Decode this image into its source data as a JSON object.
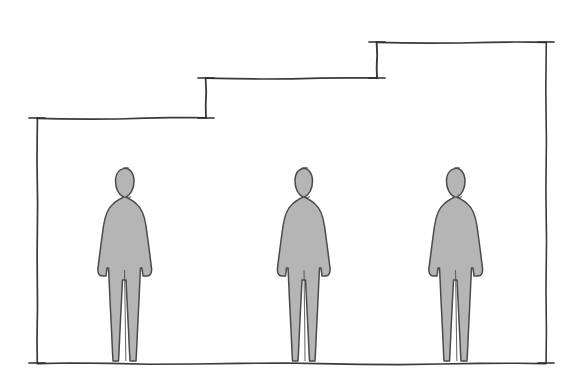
{
  "canvas": {
    "width": 583,
    "height": 389,
    "background_color": "#ffffff",
    "title": "Stepped height diagram with three standing human figures"
  },
  "style": {
    "line_color": "#3a3a3a",
    "line_width": 1.6,
    "tick_color": "#2e2e2e",
    "figure_fill": "#b5b5b5",
    "figure_stroke": "#4a4a4a",
    "figure_stroke_width": 1.5,
    "ground_color": "#3a3a3a"
  },
  "chart_data": {
    "type": "diagram",
    "title": "",
    "xlabel": "",
    "ylabel": "",
    "ground_y": 363,
    "steps": [
      {
        "name": "step-low",
        "y": 118,
        "x_start": 37,
        "x_end": 206,
        "height_px": 245
      },
      {
        "name": "step-mid",
        "y": 78,
        "x_start": 206,
        "x_end": 377,
        "height_px": 285
      },
      {
        "name": "step-high",
        "y": 42,
        "x_start": 377,
        "x_end": 546,
        "height_px": 321
      }
    ],
    "risers": [
      {
        "name": "riser-left",
        "x": 37,
        "y_top": 118,
        "y_bottom": 363
      },
      {
        "name": "riser-1",
        "x": 206,
        "y_top": 78,
        "y_bottom": 118
      },
      {
        "name": "riser-2",
        "x": 377,
        "y_top": 42,
        "y_bottom": 78
      },
      {
        "name": "riser-right",
        "x": 546,
        "y_top": 42,
        "y_bottom": 363
      }
    ],
    "tick_marks": [
      {
        "name": "tick-left-top",
        "x": 37,
        "y": 118,
        "orientation": "horizontal"
      },
      {
        "name": "tick-left-bottom",
        "x": 37,
        "y": 363,
        "orientation": "horizontal"
      },
      {
        "name": "tick-step1-top",
        "x": 206,
        "y": 78,
        "orientation": "horizontal"
      },
      {
        "name": "tick-step1-bottom",
        "x": 206,
        "y": 118,
        "orientation": "horizontal"
      },
      {
        "name": "tick-step2-top",
        "x": 377,
        "y": 42,
        "orientation": "horizontal"
      },
      {
        "name": "tick-step2-bottom",
        "x": 377,
        "y": 78,
        "orientation": "horizontal"
      },
      {
        "name": "tick-right-top",
        "x": 546,
        "y": 42,
        "orientation": "horizontal"
      },
      {
        "name": "tick-right-bottom",
        "x": 546,
        "y": 363,
        "orientation": "horizontal"
      }
    ]
  },
  "figures": [
    {
      "name": "human-figure-left",
      "label": "",
      "center_x": 128,
      "top_y": 168,
      "base_y": 363,
      "height_px": 195,
      "fill": "#b5b5b5"
    },
    {
      "name": "human-figure-center",
      "label": "",
      "center_x": 307,
      "top_y": 168,
      "base_y": 363,
      "height_px": 195,
      "fill": "#b5b5b5"
    },
    {
      "name": "human-figure-right",
      "label": "",
      "center_x": 459,
      "top_y": 168,
      "base_y": 363,
      "height_px": 195,
      "fill": "#b5b5b5"
    }
  ],
  "annotations": {
    "visible_text": [],
    "note": "No visible text labels in the drawing"
  }
}
